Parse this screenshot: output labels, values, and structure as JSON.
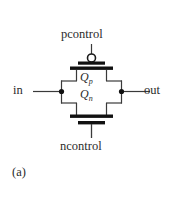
{
  "figure": {
    "caption": "(a)",
    "type": "cmos-transmission-gate-schematic",
    "background_color": "#ffffff",
    "line_color": "#3a3a3a",
    "bar_color": "#111111",
    "text_color": "#2b2b2b"
  },
  "labels": {
    "pcontrol": "pcontrol",
    "ncontrol": "ncontrol",
    "input": "in",
    "output": "out",
    "pmos_device": "Q",
    "pmos_device_sub": "p",
    "nmos_device": "Q",
    "nmos_device_sub": "n"
  },
  "nodes": {
    "left_junction_label": "in-node",
    "right_junction_label": "out-node"
  },
  "icons": {
    "inversion_bubble": "bubble-icon",
    "junction_dot": "junction-dot-icon"
  }
}
